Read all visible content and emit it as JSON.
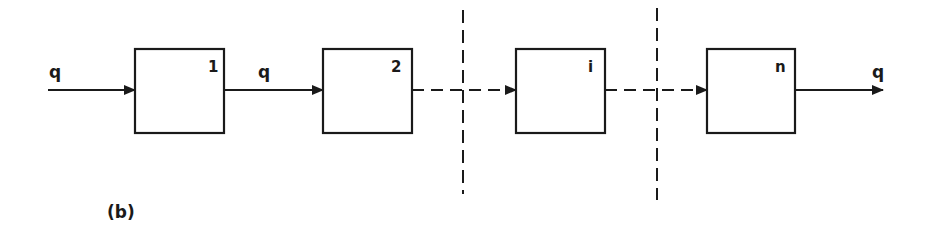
{
  "figure": {
    "caption": "(b)",
    "stroke_color": "#1a1a1a",
    "background": "#ffffff"
  },
  "input_flow": {
    "label": "q"
  },
  "output_flow": {
    "label": "q"
  },
  "blocks": [
    {
      "id": "block-1",
      "label": "1"
    },
    {
      "id": "block-2",
      "label": "2"
    },
    {
      "id": "block-i",
      "label": "i"
    },
    {
      "id": "block-n",
      "label": "n"
    }
  ],
  "connectors": [
    {
      "from": "input",
      "to": "block-1",
      "style": "solid",
      "label": "q"
    },
    {
      "from": "block-1",
      "to": "block-2",
      "style": "solid",
      "label": "q"
    },
    {
      "from": "block-2",
      "to": "block-i",
      "style": "dashed",
      "label": ""
    },
    {
      "from": "block-i",
      "to": "block-n",
      "style": "dashed",
      "label": ""
    },
    {
      "from": "block-n",
      "to": "output",
      "style": "solid",
      "label": "q"
    }
  ],
  "separators": [
    {
      "id": "separator-1",
      "style": "dashed",
      "orientation": "vertical"
    },
    {
      "id": "separator-2",
      "style": "dashed",
      "orientation": "vertical"
    }
  ]
}
